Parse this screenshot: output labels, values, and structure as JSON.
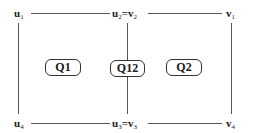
{
  "diagram": {
    "vertices": {
      "top_left": {
        "base": "u",
        "sub": "1"
      },
      "top_middle": {
        "base1": "u",
        "sub1": "2",
        "eq": "=",
        "base2": "v",
        "sub2": "2"
      },
      "top_right": {
        "base": "v",
        "sub": "1"
      },
      "bottom_left": {
        "base": "u",
        "sub": "4"
      },
      "bottom_middle": {
        "base1": "u",
        "sub1": "3",
        "eq": "=",
        "base2": "v",
        "sub2": "3"
      },
      "bottom_right": {
        "base": "v",
        "sub": "4"
      }
    },
    "regions": [
      {
        "label": "Q1"
      },
      {
        "label": "Q12"
      },
      {
        "label": "Q2"
      }
    ],
    "colors": {
      "line": "#555555",
      "text": "#1a1a1a",
      "box_border": "#333333",
      "background": "#ffffff"
    }
  }
}
